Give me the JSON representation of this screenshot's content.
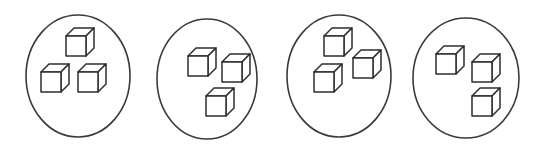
{
  "figure": {
    "description": "Four circles, each containing three small three-dimensional cubes.",
    "canvas": {
      "width": 545,
      "height": 159
    },
    "background_color": "#ffffff",
    "line_color": "#2e2e2e",
    "circle_stroke_color": "#3a3a3a",
    "group_count": 4,
    "items_per_group": 3,
    "total_items": 12,
    "item_shape": "cube"
  },
  "chart_data": {
    "type": "diagram",
    "groups": [
      {
        "label": "group-1",
        "count": 3,
        "circle": {
          "cx": 78,
          "cy": 76,
          "rx": 52,
          "ry": 61
        },
        "cubes": [
          {
            "label": "cube-1",
            "x": 66,
            "y": 36,
            "size": 20
          },
          {
            "label": "cube-2",
            "x": 41,
            "y": 72,
            "size": 20
          },
          {
            "label": "cube-3",
            "x": 78,
            "y": 72,
            "size": 20
          }
        ]
      },
      {
        "label": "group-2",
        "count": 3,
        "circle": {
          "cx": 207,
          "cy": 79,
          "rx": 50,
          "ry": 60
        },
        "cubes": [
          {
            "label": "cube-1",
            "x": 188,
            "y": 56,
            "size": 20
          },
          {
            "label": "cube-2",
            "x": 222,
            "y": 62,
            "size": 20
          },
          {
            "label": "cube-3",
            "x": 206,
            "y": 96,
            "size": 20
          }
        ]
      },
      {
        "label": "group-3",
        "count": 3,
        "circle": {
          "cx": 339,
          "cy": 76,
          "rx": 52,
          "ry": 61
        },
        "cubes": [
          {
            "label": "cube-1",
            "x": 324,
            "y": 36,
            "size": 20
          },
          {
            "label": "cube-2",
            "x": 353,
            "y": 58,
            "size": 20
          },
          {
            "label": "cube-3",
            "x": 314,
            "y": 72,
            "size": 20
          }
        ]
      },
      {
        "label": "group-4",
        "count": 3,
        "circle": {
          "cx": 466,
          "cy": 78,
          "rx": 53,
          "ry": 60
        },
        "cubes": [
          {
            "label": "cube-1",
            "x": 436,
            "y": 54,
            "size": 20
          },
          {
            "label": "cube-2",
            "x": 472,
            "y": 62,
            "size": 20
          },
          {
            "label": "cube-3",
            "x": 472,
            "y": 96,
            "size": 20
          }
        ]
      }
    ]
  }
}
